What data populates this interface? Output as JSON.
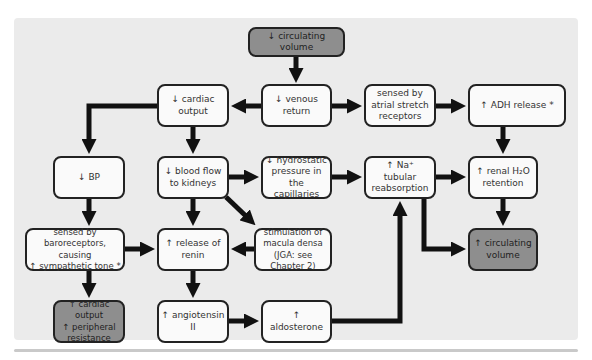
{
  "diagram": {
    "colors": {
      "panel_background": "#ebebeb",
      "box_fill": "#fafafa",
      "highlight_box_fill": "#8e8e8e",
      "arrow": "#111111",
      "border": "#222222"
    },
    "nodes": {
      "circ_vol_down": {
        "label": "↓ circulating volume",
        "highlight": true
      },
      "cardiac_output": {
        "label": "↓ cardiac\noutput"
      },
      "venous_return": {
        "label": "↓ venous\nreturn"
      },
      "atrial_stretch": {
        "label": "sensed by\natrial stretch\nreceptors"
      },
      "adh_release": {
        "label": "↑ ADH release *"
      },
      "bp": {
        "label": "↓ BP"
      },
      "blood_flow": {
        "label": "↓ blood flow\nto kidneys"
      },
      "hydrostatic": {
        "label": "↓ hydrostatic\npressure in\nthe capillaries"
      },
      "na_reabsorption": {
        "label": "↑ Na⁺\ntubular\nreabsorption"
      },
      "renal_h2o": {
        "label": "↑ renal H₂O\nretention"
      },
      "baroreceptors": {
        "label": "sensed by baroreceptors,\ncausing\n↑ sympathetic tone *"
      },
      "renin": {
        "label": "↑ release of\nrenin"
      },
      "macula_densa": {
        "label": "stimulation of\nmacula densa\n(JGA: see Chapter 2)"
      },
      "circ_vol_up": {
        "label": "↑ circulating\nvolume",
        "highlight": true
      },
      "co_resistance": {
        "label": "↑ cardiac output\n↑ peripheral\nresistance",
        "highlight": true
      },
      "angiotensin": {
        "label": "↑ angiotensin II"
      },
      "aldosterone": {
        "label": "↑ aldosterone"
      }
    },
    "edges": [
      [
        "circ_vol_down",
        "venous_return"
      ],
      [
        "venous_return",
        "cardiac_output"
      ],
      [
        "venous_return",
        "atrial_stretch"
      ],
      [
        "atrial_stretch",
        "adh_release"
      ],
      [
        "adh_release",
        "renal_h2o"
      ],
      [
        "cardiac_output",
        "bp"
      ],
      [
        "cardiac_output",
        "blood_flow"
      ],
      [
        "blood_flow",
        "hydrostatic"
      ],
      [
        "blood_flow",
        "renin"
      ],
      [
        "blood_flow",
        "macula_densa"
      ],
      [
        "hydrostatic",
        "na_reabsorption"
      ],
      [
        "na_reabsorption",
        "renal_h2o"
      ],
      [
        "na_reabsorption",
        "circ_vol_up"
      ],
      [
        "renal_h2o",
        "circ_vol_up"
      ],
      [
        "bp",
        "baroreceptors"
      ],
      [
        "baroreceptors",
        "renin"
      ],
      [
        "baroreceptors",
        "co_resistance"
      ],
      [
        "macula_densa",
        "renin"
      ],
      [
        "renin",
        "angiotensin"
      ],
      [
        "angiotensin",
        "aldosterone"
      ],
      [
        "aldosterone",
        "na_reabsorption"
      ]
    ]
  }
}
